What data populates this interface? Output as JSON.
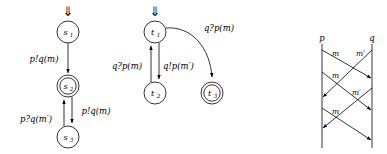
{
  "figure": {
    "caption": "",
    "automaton_p": {
      "name": "automaton-p",
      "initial_marker": "⇓",
      "states": [
        {
          "id": "s1",
          "label": "s",
          "sub": "1",
          "accepting": false,
          "cx": 68,
          "cy": 32,
          "r": 11
        },
        {
          "id": "s2",
          "label": "s",
          "sub": "2",
          "accepting": true,
          "cx": 68,
          "cy": 86,
          "r": 11
        },
        {
          "id": "s3",
          "label": "s",
          "sub": "3",
          "accepting": false,
          "cx": 68,
          "cy": 137,
          "r": 11
        }
      ],
      "transitions": [
        {
          "id": "s1-s2",
          "from": "s1",
          "to": "s2",
          "label": "p!q(m)",
          "lx": 44,
          "ly": 62
        },
        {
          "id": "s2-s3",
          "from": "s2",
          "to": "s3",
          "label": "p!q(m)",
          "lx": 96,
          "ly": 114
        },
        {
          "id": "s3-s2",
          "from": "s3",
          "to": "s2",
          "label": "p?q(m′)",
          "lx": 36,
          "ly": 122
        }
      ]
    },
    "automaton_q": {
      "name": "automaton-q",
      "initial_marker": "⇓",
      "states": [
        {
          "id": "t1",
          "label": "t",
          "sub": "1",
          "accepting": false,
          "cx": 155,
          "cy": 32,
          "r": 11
        },
        {
          "id": "t2",
          "label": "t",
          "sub": "2",
          "accepting": false,
          "cx": 155,
          "cy": 93,
          "r": 11
        },
        {
          "id": "t3",
          "label": "t",
          "sub": "3",
          "accepting": true,
          "cx": 212,
          "cy": 93,
          "r": 11
        }
      ],
      "transitions": [
        {
          "id": "t1-t2",
          "from": "t1",
          "to": "t2",
          "label": "q!p(m′)",
          "lx": 163,
          "ly": 66
        },
        {
          "id": "t2-t1",
          "from": "t2",
          "to": "t1",
          "label": "q?p(m)",
          "lx": 98,
          "ly": 66
        },
        {
          "id": "t1-t3",
          "from": "t1",
          "to": "t3",
          "label": "q?p(m)",
          "lx": 219,
          "ly": 31
        }
      ]
    },
    "msc": {
      "name": "message-sequence-chart",
      "lifelines": [
        {
          "id": "p",
          "label": "p",
          "x": 322,
          "top": 44,
          "bottom": 148
        },
        {
          "id": "q",
          "label": "q",
          "x": 372,
          "top": 44,
          "bottom": 148
        }
      ],
      "messages": [
        {
          "id": "msg1",
          "label": "m",
          "from": "p",
          "to": "q",
          "y1": 50,
          "y2": 78,
          "lx": 330,
          "ly": 55
        },
        {
          "id": "msg2",
          "label": "m′",
          "from": "q",
          "to": "p",
          "y1": 50,
          "y2": 97,
          "lx": 357,
          "ly": 55
        },
        {
          "id": "msg3",
          "label": "m",
          "from": "p",
          "to": "q",
          "y1": 70,
          "y2": 110,
          "lx": 330,
          "ly": 76
        },
        {
          "id": "msg4",
          "label": "m′",
          "from": "q",
          "to": "p",
          "y1": 88,
          "y2": 128,
          "lx": 353,
          "ly": 94
        },
        {
          "id": "msg5",
          "label": "m",
          "from": "p",
          "to": "q",
          "y1": 106,
          "y2": 140,
          "lx": 330,
          "ly": 112
        }
      ]
    }
  },
  "colors": {
    "stroke": "#000000",
    "background": "#ffffff"
  }
}
